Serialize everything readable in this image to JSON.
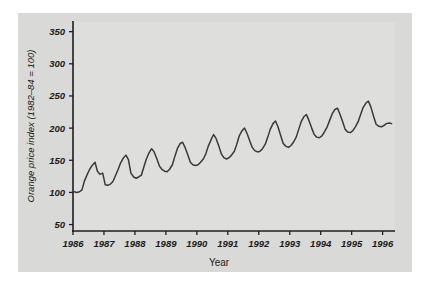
{
  "figure": {
    "background_color": "#ffffff",
    "panel_color": "#d9d9d7",
    "plot_color": "#dededc",
    "line_color": "#39393a",
    "axis_color": "#1e1e1e"
  },
  "chart_data": {
    "type": "line",
    "title": "",
    "xlabel": "Year",
    "ylabel": "Orange price index (1982–84 = 100)",
    "xlim": [
      1986.0,
      1996.4
    ],
    "ylim": [
      40,
      365
    ],
    "grid": false,
    "legend": null,
    "xticks": [
      1986,
      1987,
      1988,
      1989,
      1990,
      1991,
      1992,
      1993,
      1994,
      1995,
      1996
    ],
    "xtick_labels": [
      "1986",
      "1987",
      "1988",
      "1989",
      "1990",
      "1991",
      "1992",
      "1993",
      "1994",
      "1995",
      "1996"
    ],
    "yticks": [
      50,
      100,
      150,
      200,
      250,
      300,
      350
    ],
    "ytick_labels": [
      "50",
      "100",
      "150",
      "200",
      "250",
      "300",
      "350"
    ],
    "series": [
      {
        "name": "Orange price index",
        "x": [
          1986.04,
          1986.12,
          1986.21,
          1986.29,
          1986.37,
          1986.46,
          1986.54,
          1986.62,
          1986.71,
          1986.79,
          1986.87,
          1986.96,
          1987.04,
          1987.12,
          1987.21,
          1987.29,
          1987.37,
          1987.46,
          1987.54,
          1987.62,
          1987.71,
          1987.79,
          1987.87,
          1987.96,
          1988.04,
          1988.12,
          1988.21,
          1988.29,
          1988.37,
          1988.46,
          1988.54,
          1988.62,
          1988.71,
          1988.79,
          1988.87,
          1988.96,
          1989.04,
          1989.12,
          1989.21,
          1989.29,
          1989.37,
          1989.46,
          1989.54,
          1989.62,
          1989.71,
          1989.79,
          1989.87,
          1989.96,
          1990.04,
          1990.12,
          1990.21,
          1990.29,
          1990.37,
          1990.46,
          1990.54,
          1990.62,
          1990.71,
          1990.79,
          1990.87,
          1990.96,
          1991.04,
          1991.12,
          1991.21,
          1991.29,
          1991.37,
          1991.46,
          1991.54,
          1991.62,
          1991.71,
          1991.79,
          1991.87,
          1991.96,
          1992.04,
          1992.12,
          1992.21,
          1992.29,
          1992.37,
          1992.46,
          1992.54,
          1992.62,
          1992.71,
          1992.79,
          1992.87,
          1992.96,
          1993.04,
          1993.12,
          1993.21,
          1993.29,
          1993.37,
          1993.46,
          1993.54,
          1993.62,
          1993.71,
          1993.79,
          1993.87,
          1993.96,
          1994.04,
          1994.12,
          1994.21,
          1994.29,
          1994.37,
          1994.46,
          1994.54,
          1994.62,
          1994.71,
          1994.79,
          1994.87,
          1994.96,
          1995.04,
          1995.12,
          1995.21,
          1995.29,
          1995.37,
          1995.46,
          1995.54,
          1995.62,
          1995.71,
          1995.79,
          1995.87,
          1995.96,
          1996.04,
          1996.12,
          1996.21,
          1996.29
        ],
        "y": [
          101,
          100,
          101,
          104,
          118,
          128,
          136,
          142,
          147,
          133,
          128,
          130,
          112,
          111,
          113,
          117,
          126,
          136,
          146,
          153,
          158,
          151,
          130,
          124,
          122,
          124,
          127,
          140,
          152,
          162,
          168,
          163,
          152,
          141,
          136,
          133,
          132,
          136,
          143,
          156,
          168,
          176,
          178,
          170,
          158,
          147,
          143,
          142,
          143,
          147,
          152,
          160,
          172,
          182,
          190,
          184,
          172,
          160,
          154,
          152,
          154,
          158,
          164,
          175,
          188,
          196,
          200,
          192,
          180,
          170,
          165,
          163,
          164,
          168,
          175,
          186,
          198,
          207,
          211,
          202,
          188,
          176,
          172,
          170,
          173,
          178,
          186,
          198,
          210,
          218,
          221,
          212,
          200,
          190,
          186,
          185,
          188,
          194,
          202,
          212,
          222,
          229,
          231,
          222,
          210,
          198,
          194,
          193,
          196,
          202,
          210,
          221,
          232,
          239,
          242,
          233,
          218,
          206,
          203,
          202,
          204,
          207,
          208,
          207
        ]
      }
    ]
  }
}
